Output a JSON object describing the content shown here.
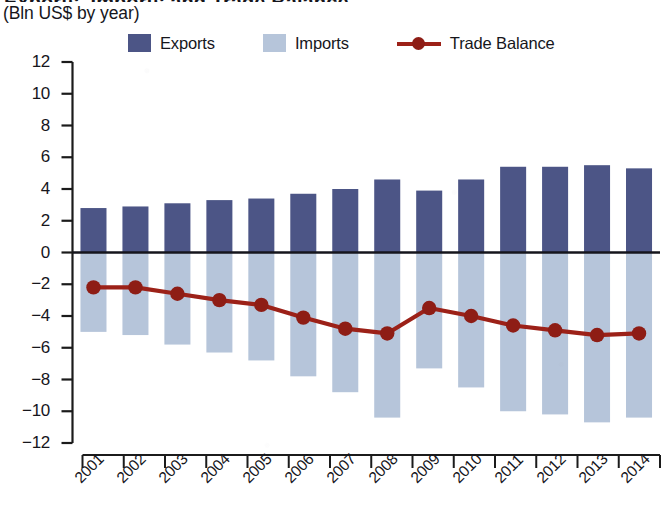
{
  "header": {
    "title_clipped": "Exports, Imports and Trade Balance",
    "subtitle": "(Bln US$ by year)"
  },
  "legend": {
    "position": "top",
    "items": [
      {
        "label": "Exports",
        "marker": "square-swatch",
        "color": "#4c5586",
        "icon": "square-icon"
      },
      {
        "label": "Imports",
        "marker": "square-swatch",
        "color": "#b6c5da",
        "icon": "square-icon"
      },
      {
        "label": "Trade Balance",
        "marker": "line-with-dot",
        "color": "#9c2118",
        "icon": "line-marker-icon"
      }
    ]
  },
  "axes": {
    "y": {
      "ticks": [
        12,
        10,
        8,
        6,
        4,
        2,
        0,
        -2,
        -4,
        -6,
        -8,
        -10,
        -12
      ],
      "tick_labels": [
        "12",
        "10",
        "8",
        "6",
        "4",
        "2",
        "0",
        "-2",
        "-4",
        "-6",
        "-8",
        "-10",
        "-12"
      ],
      "min": -12,
      "max": 12,
      "step": 2
    },
    "x": {
      "tick_labels": [
        "2001",
        "2002",
        "2003",
        "2004",
        "2005",
        "2006",
        "2007",
        "2008",
        "2009",
        "2010",
        "2011",
        "2012",
        "2013",
        "2014"
      ],
      "label_rotation": -45
    }
  },
  "chart_data": {
    "type": "bar",
    "title": "Exports, Imports and Trade Balance",
    "subtitle": "(Bln US$ by year)",
    "xlabel": "",
    "ylabel": "Bln US$",
    "ylim": [
      -12,
      12
    ],
    "ytick_step": 2,
    "grid": false,
    "legend_position": "top",
    "categories": [
      "2001",
      "2002",
      "2003",
      "2004",
      "2005",
      "2006",
      "2007",
      "2008",
      "2009",
      "2010",
      "2011",
      "2012",
      "2013",
      "2014"
    ],
    "series": [
      {
        "name": "Exports",
        "type": "bar",
        "color": "#4c5586",
        "values": [
          2.8,
          2.9,
          3.1,
          3.3,
          3.4,
          3.7,
          4.0,
          4.6,
          3.9,
          4.6,
          5.4,
          5.4,
          5.5,
          5.3
        ]
      },
      {
        "name": "Imports",
        "type": "bar",
        "color": "#b6c5da",
        "values": [
          -5.0,
          -5.2,
          -5.8,
          -6.3,
          -6.8,
          -7.8,
          -8.8,
          -10.4,
          -7.3,
          -8.5,
          -10.0,
          -10.2,
          -10.7,
          -10.4
        ]
      },
      {
        "name": "Trade Balance",
        "type": "line",
        "color": "#9c2118",
        "values": [
          -2.2,
          -2.2,
          -2.6,
          -3.0,
          -3.3,
          -4.1,
          -4.8,
          -5.1,
          -3.5,
          -4.0,
          -4.6,
          -4.9,
          -5.2,
          -5.1
        ]
      }
    ]
  }
}
